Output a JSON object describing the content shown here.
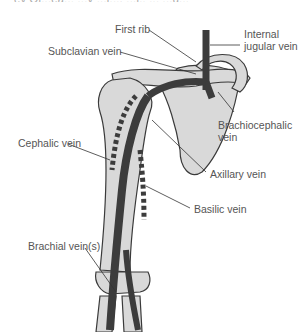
{
  "caption_fragment": "ey Ol...ea... ...y ...l..., ...l.. ... ...g...",
  "colors": {
    "bone_fill": "#d9d9d9",
    "bone_stroke": "#3a3a3a",
    "deep_vein": "#3c3c3c",
    "superficial_vein_dash": "#3c3c3c",
    "label_text": "#555555",
    "leader_line": "#333333"
  },
  "labels": {
    "first_rib": "First rib",
    "internal_jugular_line1": "Internal",
    "internal_jugular_line2": "jugular vein",
    "subclavian": "Subclavian vein",
    "brachiocephalic_line1": "Brachiocephalic",
    "brachiocephalic_line2": "vein",
    "cephalic": "Cephalic vein",
    "axillary": "Axillary vein",
    "brachial": "Brachial vein(s)",
    "basilic": "Basilic vein"
  }
}
